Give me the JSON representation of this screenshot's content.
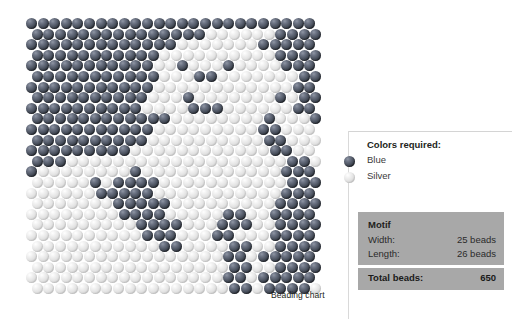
{
  "chart": {
    "caption": "Beading chart",
    "grid": {
      "columns": 25,
      "rows": 26,
      "bead_size_px": 11,
      "row_step_px": 10.6,
      "col_step_px": 11.6,
      "offset_px": 5.8
    },
    "palette": {
      "blue": "#4b525f",
      "silver": "#e2e2e2"
    },
    "legend_keys": {
      "1": "blue",
      "0": "silver"
    },
    "pattern": [
      "1111111111111111111111111",
      "1111111111111110000001111",
      "1111111111111000000011111",
      "1111111111100000000001111",
      "1111111111100100010000111",
      "1111111111100011000000011",
      "1111111111100000000000011",
      "1111111111000100000001011",
      "1111111111000011100000011",
      "1111111111110000000010001",
      "1111111111100000000011000",
      "1111111111000000000011000",
      "1111111110000000000001100",
      "1110000000000000000000110",
      "1000000001000000000000111",
      "0000010111100000000000111",
      "0000001111100000000000111",
      "0000000111110000000001111",
      "0000000011110000011001111",
      "0000000001111000111001111",
      "0000000000111000110001111",
      "0000000000011000011001111",
      "0000000000000000011011111",
      "0000000000000000011001111",
      "0000000000000000011011111",
      "0000000000000000011011110"
    ]
  },
  "panel": {
    "colors_title": "Colors required:",
    "legend": [
      {
        "label": "Blue",
        "swatch": "blue"
      },
      {
        "label": "Silver",
        "swatch": "silver"
      }
    ],
    "motif": {
      "title": "Motif",
      "rows": [
        {
          "key": "Width:",
          "value": "25 beads"
        },
        {
          "key": "Length:",
          "value": "26 beads"
        }
      ],
      "total_key": "Total beads:",
      "total_value": "650"
    },
    "box_color": "#a8a8a8"
  }
}
